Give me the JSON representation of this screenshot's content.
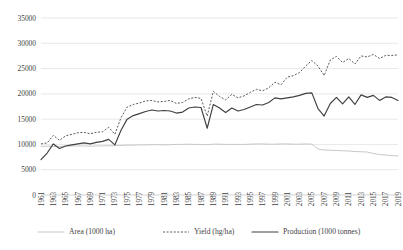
{
  "chart_data": {
    "type": "line",
    "title": "",
    "xlabel": "",
    "ylabel": "",
    "ylim": [
      0,
      35000
    ],
    "yticks": [
      0,
      5000,
      10000,
      15000,
      20000,
      25000,
      30000,
      35000
    ],
    "ytick_labels": [
      "0",
      "5000",
      "10000",
      "15000",
      "20000",
      "25000",
      "30000",
      "35000"
    ],
    "grid": true,
    "legend_position": "bottom",
    "x": [
      1961,
      1962,
      1963,
      1964,
      1965,
      1966,
      1967,
      1968,
      1969,
      1970,
      1971,
      1972,
      1973,
      1974,
      1975,
      1976,
      1977,
      1978,
      1979,
      1980,
      1981,
      1982,
      1983,
      1984,
      1985,
      1986,
      1987,
      1988,
      1989,
      1990,
      1991,
      1992,
      1993,
      1994,
      1995,
      1996,
      1997,
      1998,
      1999,
      2000,
      2001,
      2002,
      2003,
      2004,
      2005,
      2006,
      2007,
      2008,
      2009,
      2010,
      2011,
      2012,
      2013,
      2014,
      2015,
      2016,
      2017,
      2018,
      2019
    ],
    "xtick_labels": [
      "1961",
      "1963",
      "1965",
      "1967",
      "1969",
      "1971",
      "1973",
      "1975",
      "1977",
      "1979",
      "1981",
      "1983",
      "1985",
      "1987",
      "1989",
      "1991",
      "1993",
      "1995",
      "1997",
      "1999",
      "2001",
      "2003",
      "2005",
      "2007",
      "2009",
      "2011",
      "2013",
      "2015",
      "2017",
      "2019"
    ],
    "series": [
      {
        "name": "Area (1000 ha)",
        "style": "solid-light",
        "color": "#c8c8c8",
        "values": [
          9600,
          9650,
          9600,
          9600,
          9650,
          9700,
          9700,
          9700,
          9650,
          9700,
          9700,
          9750,
          9750,
          9800,
          9850,
          9850,
          9900,
          9900,
          9950,
          9950,
          9900,
          9950,
          10000,
          10000,
          10050,
          10000,
          10000,
          9950,
          10050,
          10050,
          10000,
          10000,
          10000,
          10000,
          10050,
          10100,
          10100,
          10050,
          10050,
          10100,
          10100,
          10050,
          10050,
          10100,
          10050,
          9100,
          8900,
          8850,
          8800,
          8750,
          8700,
          8600,
          8550,
          8500,
          8200,
          8000,
          7900,
          7800,
          7700
        ]
      },
      {
        "name": "Yield (hg/ha)",
        "style": "dotted",
        "color": "#5a5a5a",
        "values": [
          10100,
          10300,
          11800,
          10800,
          11700,
          12000,
          12300,
          12400,
          12100,
          12400,
          12500,
          13400,
          12000,
          15300,
          17400,
          17900,
          18200,
          18600,
          18700,
          18400,
          18500,
          18700,
          18100,
          18300,
          19000,
          19300,
          19100,
          15600,
          20500,
          19500,
          18800,
          19900,
          19200,
          19600,
          20300,
          20900,
          20600,
          21200,
          22300,
          21800,
          23300,
          23600,
          24200,
          25500,
          26600,
          25500,
          23600,
          26700,
          27400,
          26200,
          27000,
          25900,
          27500,
          27300,
          27800,
          27000,
          27600,
          27600,
          27700
        ]
      },
      {
        "name": "Production (1000 tonnes)",
        "style": "solid-dark",
        "color": "#404040",
        "values": [
          7000,
          8300,
          10100,
          9200,
          9700,
          9900,
          10100,
          10300,
          10100,
          10400,
          10600,
          11000,
          9900,
          12800,
          15000,
          15700,
          16100,
          16500,
          16800,
          16600,
          16700,
          16600,
          16200,
          16400,
          17200,
          17400,
          17300,
          13200,
          17900,
          17200,
          16300,
          17200,
          16600,
          16900,
          17400,
          17900,
          17800,
          18300,
          19200,
          19000,
          19200,
          19400,
          19700,
          20100,
          20200,
          17100,
          15600,
          18100,
          19300,
          18000,
          19400,
          17900,
          19800,
          19300,
          19700,
          18700,
          19400,
          19300,
          18700
        ]
      }
    ]
  },
  "legend": {
    "items": [
      {
        "label": "Area (1000 ha)",
        "marker": "solid-light-line"
      },
      {
        "label": "Yield (hg/ha)",
        "marker": "dotted-line"
      },
      {
        "label": "Production (1000 tonnes)",
        "marker": "solid-dark-line"
      }
    ]
  }
}
